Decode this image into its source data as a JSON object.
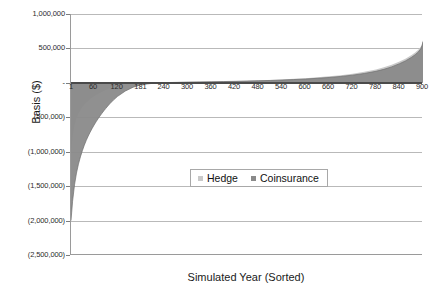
{
  "chart_data": {
    "type": "area",
    "title": "",
    "subtitle": "",
    "xlabel": "Simulated Year (Sorted)",
    "ylabel": "Basis ($)",
    "grid": true,
    "legend_position": "center",
    "xlim": [
      1,
      900
    ],
    "ylim": [
      -2500000,
      1000000
    ],
    "y_ticks": [
      1000000,
      500000,
      0,
      -500000,
      -1000000,
      -1500000,
      -2000000,
      -2500000
    ],
    "y_tick_labels": [
      "1,000,000",
      "500,000",
      "-",
      "(500,000)",
      "(1,000,000)",
      "(1,500,000)",
      "(2,000,000)",
      "(2,500,000)"
    ],
    "x_ticks": [
      1,
      60,
      120,
      181,
      240,
      300,
      360,
      420,
      480,
      540,
      600,
      660,
      720,
      780,
      840,
      900
    ],
    "x_tick_labels": [
      "1",
      "60",
      "120",
      "181",
      "240",
      "300",
      "360",
      "420",
      "480",
      "540",
      "600",
      "660",
      "720",
      "780",
      "840",
      "900"
    ],
    "colors": {
      "hedge": "#c9c9c9",
      "coinsurance": "#8a8a8a",
      "gridline": "#b9b9b9",
      "axis": "#9a9a9a",
      "text": "#2b2b2b"
    },
    "series": [
      {
        "name": "Hedge",
        "color": "#c9c9c9",
        "x": [
          1,
          5,
          10,
          15,
          20,
          25,
          30,
          35,
          40,
          45,
          50,
          55,
          60,
          65,
          70,
          75,
          80,
          85,
          90,
          95,
          100,
          110,
          120,
          140,
          160,
          181,
          210,
          240,
          270,
          300,
          330,
          360,
          390,
          420,
          450,
          480,
          510,
          540,
          570,
          600,
          630,
          660,
          690,
          720,
          750,
          780,
          800,
          820,
          840,
          855,
          870,
          880,
          888,
          894,
          898,
          900
        ],
        "values": [
          -1050000,
          -800000,
          -620000,
          -520000,
          -450000,
          -400000,
          -355000,
          -318000,
          -288000,
          -262000,
          -238000,
          -218000,
          -198000,
          -180000,
          -163000,
          -148000,
          -133000,
          -119000,
          -105000,
          -92000,
          -80000,
          -58000,
          -40000,
          -16000,
          -4000,
          2000,
          6000,
          9000,
          12000,
          15000,
          18000,
          21000,
          24000,
          28000,
          32000,
          37000,
          43000,
          50000,
          58000,
          68000,
          80000,
          95000,
          112000,
          134000,
          160000,
          195000,
          225000,
          262000,
          310000,
          350000,
          400000,
          440000,
          480000,
          520000,
          570000,
          620000
        ]
      },
      {
        "name": "Coinsurance",
        "color": "#8a8a8a",
        "x": [
          1,
          5,
          10,
          15,
          20,
          25,
          30,
          35,
          40,
          45,
          50,
          55,
          60,
          65,
          70,
          75,
          80,
          85,
          90,
          95,
          100,
          110,
          120,
          140,
          160,
          181,
          210,
          240,
          270,
          300,
          330,
          360,
          390,
          420,
          450,
          480,
          510,
          540,
          570,
          600,
          630,
          660,
          690,
          720,
          750,
          780,
          800,
          820,
          840,
          855,
          870,
          880,
          888,
          894,
          898,
          900
        ],
        "values": [
          -2000000,
          -1720000,
          -1480000,
          -1310000,
          -1180000,
          -1075000,
          -985000,
          -905000,
          -835000,
          -772000,
          -715000,
          -662000,
          -612000,
          -566000,
          -522000,
          -481000,
          -442000,
          -405000,
          -370000,
          -336000,
          -304000,
          -246000,
          -196000,
          -118000,
          -62000,
          -26000,
          -6000,
          3000,
          7000,
          10000,
          13000,
          16000,
          19000,
          22000,
          26000,
          30000,
          35000,
          41000,
          48000,
          56000,
          66000,
          78000,
          93000,
          112000,
          136000,
          168000,
          196000,
          232000,
          278000,
          318000,
          368000,
          408000,
          448000,
          492000,
          545000,
          600000
        ]
      }
    ]
  },
  "legend": {
    "items": [
      {
        "label": "Hedge",
        "color": "#c9c9c9"
      },
      {
        "label": "Coinsurance",
        "color": "#8a8a8a"
      }
    ]
  },
  "axes": {
    "y_title": "Basis ($)",
    "x_title": "Simulated Year (Sorted)"
  }
}
